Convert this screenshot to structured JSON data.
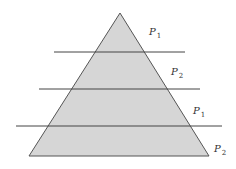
{
  "diagram": {
    "type": "pyramid-with-cutting-lines",
    "colors": {
      "fill": "#d6d6d6",
      "stroke": "#555555",
      "line": "#444444",
      "text": "#333333"
    },
    "triangle": {
      "apex": [
        120,
        13
      ],
      "base_left": [
        29,
        156
      ],
      "base_right": [
        209,
        156
      ]
    },
    "lines": [
      {
        "x1": 54,
        "x2": 185,
        "y": 52
      },
      {
        "x1": 39,
        "x2": 200,
        "y": 89
      },
      {
        "x1": 16,
        "x2": 222,
        "y": 126
      }
    ],
    "labels": [
      {
        "main": "P",
        "sub": "1",
        "x": 149,
        "y": 35
      },
      {
        "main": "P",
        "sub": "2",
        "x": 171,
        "y": 75
      },
      {
        "main": "P",
        "sub": "1",
        "x": 193,
        "y": 114
      },
      {
        "main": "P",
        "sub": "2",
        "x": 214,
        "y": 152
      }
    ]
  }
}
